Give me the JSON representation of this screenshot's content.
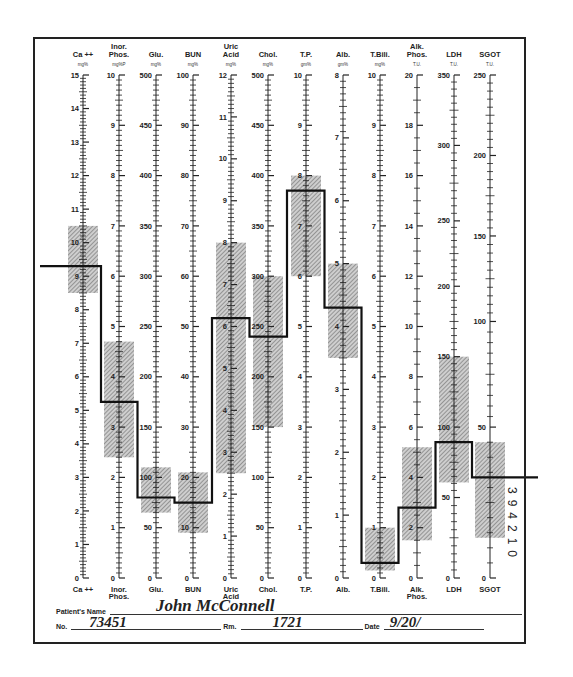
{
  "chart_data": {
    "type": "line",
    "layout": {
      "axis_top_y": 75,
      "axis_bottom_y": 578,
      "grid": false,
      "legend": "none"
    },
    "series_style": {
      "line_color": "#111111",
      "band_color": "#9a9a9a"
    },
    "axes": [
      {
        "key": "ca",
        "label_top": [
          "Ca ++"
        ],
        "unit": "mg%",
        "label_bottom": [
          "Ca ++"
        ],
        "x": 83,
        "min": 0,
        "max": 15,
        "major_step": 1,
        "minor_per_major": 10,
        "tick_labels": [
          1,
          2,
          3,
          4,
          5,
          6,
          7,
          8,
          9,
          10,
          11,
          12,
          13,
          14,
          15
        ],
        "normal_range": [
          8.5,
          10.5
        ],
        "value": 9.3,
        "scale": "linear"
      },
      {
        "key": "phos",
        "label_top": [
          "Inor.",
          "Phos."
        ],
        "unit": "mg%P",
        "label_bottom": [
          "Inor.",
          "Phos."
        ],
        "x": 119,
        "min": 0,
        "max": 10,
        "major_step": 1,
        "minor_per_major": 10,
        "tick_labels": [
          1,
          2,
          3,
          4,
          5,
          6,
          7,
          8,
          9,
          10
        ],
        "normal_range": [
          2.4,
          4.7
        ],
        "value": 3.5,
        "scale": "linear"
      },
      {
        "key": "glu",
        "label_top": [
          "Glu."
        ],
        "unit": "mg%",
        "label_bottom": [
          "Glu."
        ],
        "x": 156,
        "min": 0,
        "max": 500,
        "major_step": 50,
        "minor_per_major": 10,
        "tick_labels": [
          50,
          100,
          150,
          200,
          250,
          300,
          350,
          400,
          450,
          500
        ],
        "normal_range": [
          65,
          110
        ],
        "value": 80,
        "scale": "linear"
      },
      {
        "key": "bun",
        "label_top": [
          "BUN"
        ],
        "unit": "mg%",
        "label_bottom": [
          "BUN"
        ],
        "x": 193,
        "min": 0,
        "max": 100,
        "major_step": 10,
        "minor_per_major": 10,
        "tick_labels": [
          10,
          20,
          30,
          40,
          50,
          60,
          70,
          80,
          90,
          100
        ],
        "normal_range": [
          9,
          21
        ],
        "value": 15,
        "scale": "linear"
      },
      {
        "key": "uric",
        "label_top": [
          "Uric",
          "Acid"
        ],
        "unit": "mg%",
        "label_bottom": [
          "Uric",
          "Acid"
        ],
        "x": 231,
        "min": 0,
        "max": 12,
        "major_step": 1,
        "minor_per_major": 10,
        "tick_labels": [
          1,
          2,
          3,
          4,
          5,
          6,
          7,
          8,
          9,
          10,
          11,
          12
        ],
        "normal_range": [
          2.5,
          8
        ],
        "value": 6.2,
        "scale": "linear"
      },
      {
        "key": "chol",
        "label_top": [
          "Chol."
        ],
        "unit": "mg%",
        "label_bottom": [
          "Chol."
        ],
        "x": 268,
        "min": 0,
        "max": 500,
        "major_step": 50,
        "minor_per_major": 10,
        "tick_labels": [
          50,
          100,
          150,
          200,
          250,
          300,
          350,
          400,
          450,
          500
        ],
        "normal_range": [
          150,
          300
        ],
        "value": 240,
        "scale": "linear"
      },
      {
        "key": "tp",
        "label_top": [
          "T.P."
        ],
        "unit": "gm%",
        "label_bottom": [
          "T.P."
        ],
        "x": 306,
        "min": 0,
        "max": 10,
        "major_step": 1,
        "minor_per_major": 10,
        "tick_labels": [
          1,
          2,
          3,
          4,
          5,
          6,
          7,
          8,
          9,
          10
        ],
        "normal_range": [
          6,
          8
        ],
        "value": 7.7,
        "scale": "linear"
      },
      {
        "key": "alb",
        "label_top": [
          "Alb."
        ],
        "unit": "gm%",
        "label_bottom": [
          "Alb."
        ],
        "x": 343,
        "min": 0,
        "max": 8,
        "major_step": 1,
        "minor_per_major": 10,
        "tick_labels": [
          1,
          2,
          3,
          4,
          5,
          6,
          7,
          8
        ],
        "normal_range": [
          3.5,
          5
        ],
        "value": 4.3,
        "scale": "linear"
      },
      {
        "key": "tbili",
        "label_top": [
          "T.Bili."
        ],
        "unit": "mg%",
        "label_bottom": [
          "T.Bili."
        ],
        "x": 380,
        "min": 0,
        "max": 10,
        "major_step": 1,
        "minor_per_major": 10,
        "tick_labels": [
          1,
          2,
          3,
          4,
          5,
          6,
          7,
          8,
          9,
          10
        ],
        "normal_range": [
          0.15,
          1
        ],
        "value": 0.3,
        "scale": "linear"
      },
      {
        "key": "alk",
        "label_top": [
          "Alk.",
          "Phos."
        ],
        "unit": "T.U.",
        "label_bottom": [
          "Alk.",
          "Phos."
        ],
        "x": 417,
        "min": 0,
        "max": 20,
        "major_step": 2,
        "minor_per_major": 4,
        "tick_labels": [
          2,
          4,
          6,
          8,
          10,
          12,
          14,
          16,
          18,
          20
        ],
        "normal_range": [
          1.5,
          5.2
        ],
        "value": 2.8,
        "scale": "linear"
      },
      {
        "key": "ldh",
        "label_top": [
          "LDH"
        ],
        "unit": "T.U.",
        "label_bottom": [
          "LDH"
        ],
        "x": 454,
        "min": 0,
        "max": 350,
        "tick_labels": [
          50,
          100,
          150,
          200,
          250,
          300,
          350
        ],
        "tick_positions_frac": [
          0.16,
          0.3,
          0.44,
          0.58,
          0.71,
          0.86,
          1.0
        ],
        "normal_range_frac": [
          0.19,
          0.44
        ],
        "value_frac": 0.27,
        "value": 70,
        "scale": "nonlinear"
      },
      {
        "key": "sgot",
        "label_top": [
          "SGOT"
        ],
        "unit": "T.U.",
        "label_bottom": [
          "SGOT"
        ],
        "x": 490,
        "min": 0,
        "max": 250,
        "tick_labels": [
          50,
          100,
          150,
          200,
          250
        ],
        "tick_positions_frac": [
          0.3,
          0.51,
          0.68,
          0.84,
          1.0
        ],
        "normal_range_frac": [
          0.08,
          0.27
        ],
        "value_frac": 0.2,
        "value": 20,
        "scale": "nonlinear"
      }
    ],
    "line_entry_x": 40,
    "line_exit_x": 538
  },
  "form": {
    "patient_name_label": "Patient's Name",
    "patient_name_value": "John McConnell",
    "no_label": "No.",
    "no_value": "73451",
    "rm_label": "Rm.",
    "rm_value": "1721",
    "date_label": "Date",
    "date_value": "9/20/"
  },
  "side_code": "394210"
}
